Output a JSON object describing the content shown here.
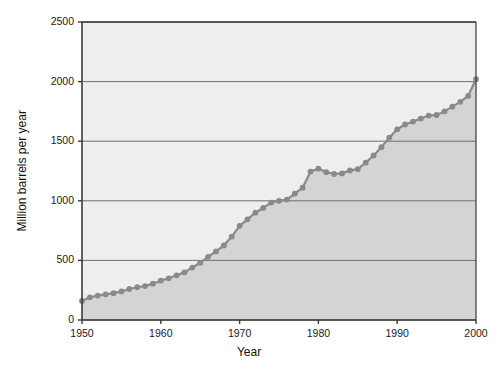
{
  "chart_data": {
    "type": "area",
    "title": "",
    "subtitle": "",
    "xlabel": "Year",
    "ylabel": "Million barrels per year",
    "xlim": [
      1950,
      2000
    ],
    "ylim": [
      0,
      2500
    ],
    "x_ticks": [
      "1950",
      "1960",
      "1970",
      "1980",
      "1990",
      "2000"
    ],
    "x_tick_values": [
      1950,
      1960,
      1970,
      1980,
      1990,
      2000
    ],
    "y_ticks": [
      "0",
      "500",
      "1000",
      "1500",
      "2000",
      "2500"
    ],
    "y_tick_values": [
      0,
      500,
      1000,
      1500,
      2000,
      2500
    ],
    "grid": "horizontal",
    "legend": "none",
    "markers": "circle",
    "series_name": "Oil production",
    "x": [
      1950,
      1951,
      1952,
      1953,
      1954,
      1955,
      1956,
      1957,
      1958,
      1959,
      1960,
      1961,
      1962,
      1963,
      1964,
      1965,
      1966,
      1967,
      1968,
      1969,
      1970,
      1971,
      1972,
      1973,
      1974,
      1975,
      1976,
      1977,
      1978,
      1979,
      1980,
      1981,
      1982,
      1983,
      1984,
      1985,
      1986,
      1987,
      1988,
      1989,
      1990,
      1991,
      1992,
      1993,
      1994,
      1995,
      1996,
      1997,
      1998,
      1999,
      2000
    ],
    "values": [
      160,
      190,
      205,
      215,
      225,
      240,
      260,
      275,
      285,
      305,
      330,
      350,
      375,
      400,
      440,
      480,
      530,
      575,
      625,
      700,
      790,
      845,
      900,
      940,
      985,
      1000,
      1010,
      1060,
      1110,
      1245,
      1270,
      1240,
      1225,
      1230,
      1255,
      1265,
      1320,
      1380,
      1450,
      1530,
      1600,
      1640,
      1665,
      1690,
      1715,
      1720,
      1750,
      1790,
      1830,
      1880,
      2020
    ],
    "colors": {
      "plot_background": "#eeeeee",
      "area_fill": "#d4d4d4",
      "line": "#8a8a8a",
      "marker": "#8a8a8a",
      "grid": "#6f6f6f",
      "axis": "#3a3a3a",
      "text": "#1a1a1a"
    },
    "plot_area": {
      "left": 82,
      "top": 22,
      "right": 476,
      "bottom": 320
    }
  }
}
